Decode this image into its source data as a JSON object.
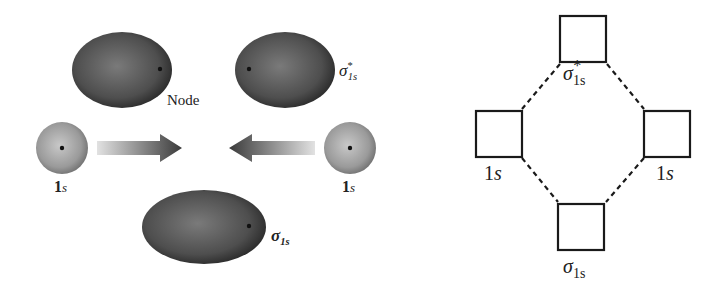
{
  "left_panel": {
    "node_label": "Node",
    "atomic_orbital_left": {
      "label_main": "1",
      "label_sub": "s"
    },
    "atomic_orbital_right": {
      "label_main": "1",
      "label_sub": "s"
    },
    "antibonding": {
      "symbol": "σ",
      "sup": "*",
      "sub": "1s"
    },
    "bonding": {
      "symbol": "σ",
      "sub": "1s"
    }
  },
  "right_panel": {
    "antibonding": {
      "symbol": "σ",
      "sub": "1s",
      "sup": "*"
    },
    "left_ao": {
      "label_main": "1",
      "label_sub": "s"
    },
    "right_ao": {
      "label_main": "1",
      "label_sub": "s"
    },
    "bonding": {
      "symbol": "σ",
      "sub": "1s"
    }
  },
  "colors": {
    "orbital_dark": "#2e2e2e",
    "orbital_mid": "#6a6a6a",
    "sphere_light": "#b4b4b4",
    "box_stroke": "#1a1a1a"
  }
}
